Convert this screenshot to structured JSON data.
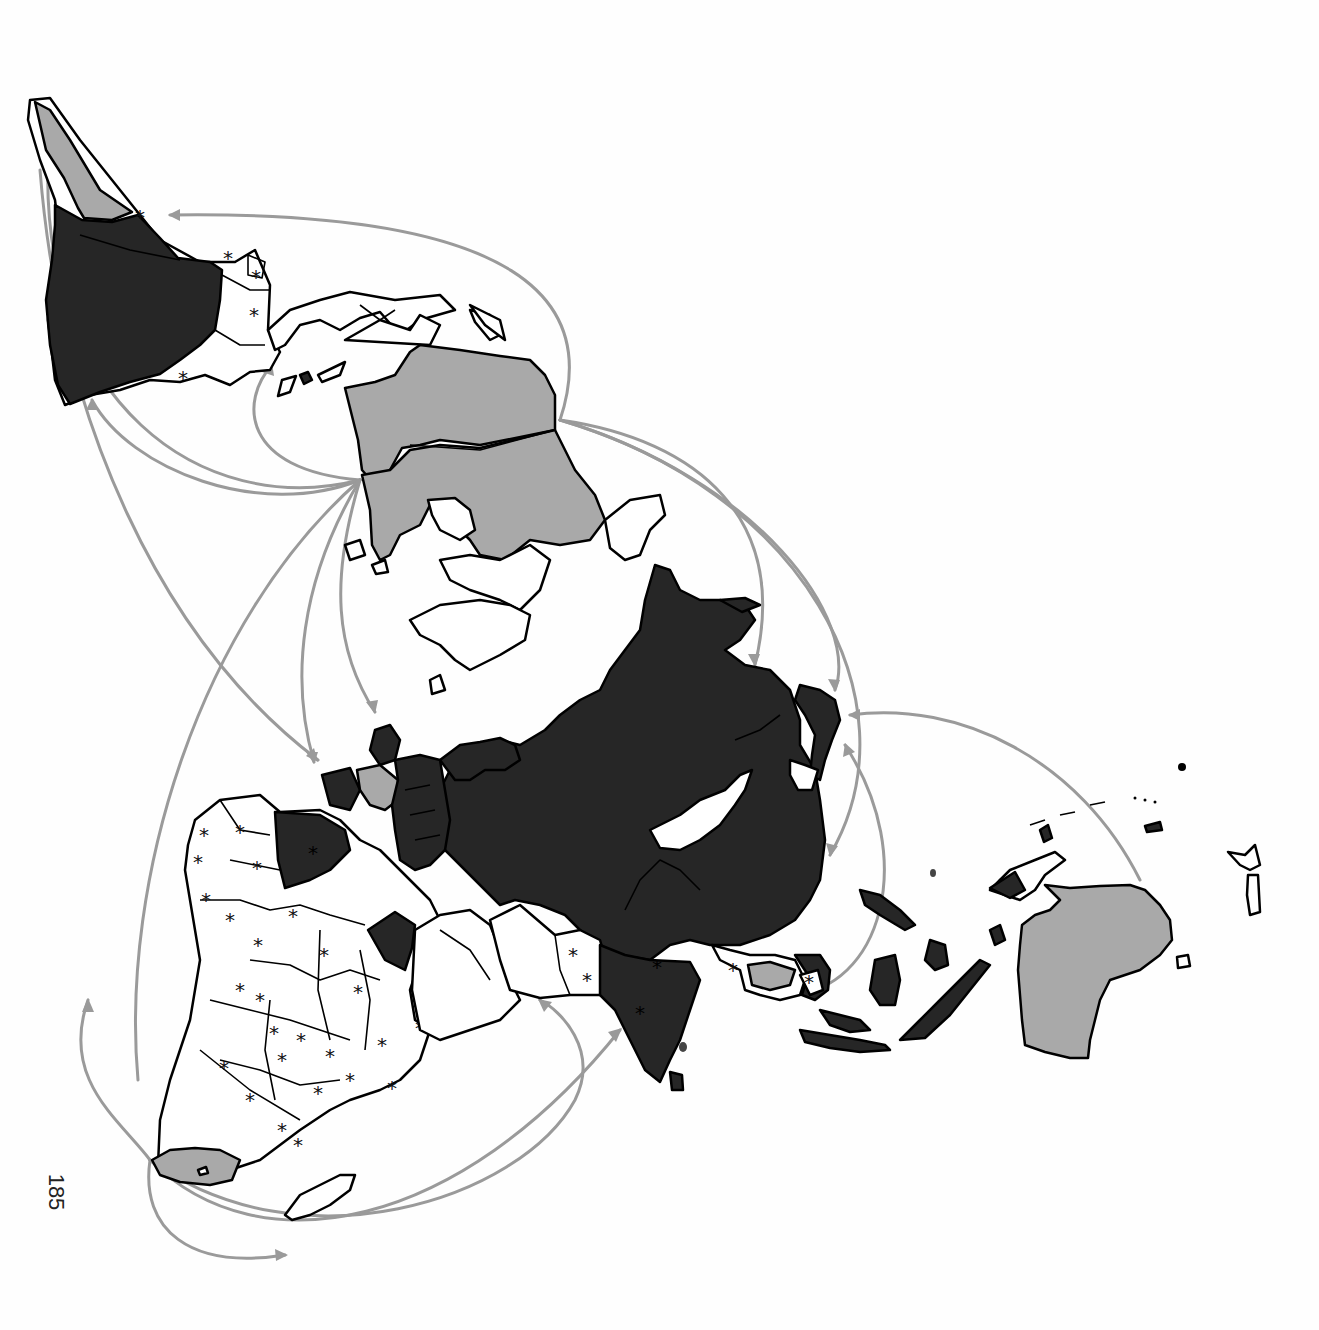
{
  "page": {
    "page_number": "185",
    "page_number_orientation": "rotated 90deg clockwise"
  },
  "map": {
    "type": "thematic world map (rotated projection, south at upper-left)",
    "legend_visible": false,
    "colors": {
      "dark_fill": "#262626",
      "grey_fill": "#a9a9a9",
      "white_fill": "#ffffff",
      "outline": "#000000",
      "flow_arrows": "#9a9a9a"
    },
    "categories": [
      {
        "shade": "dark",
        "regions": [
          "Argentina / southern South America",
          "Mexico",
          "Western & Central Europe",
          "Russia / Soviet Union",
          "China",
          "India",
          "Indonesia",
          "Japan",
          "Philippines",
          "Algeria",
          "Egypt",
          "Northern Korea"
        ]
      },
      {
        "shade": "grey",
        "regions": [
          "Chile",
          "Canada",
          "United States",
          "France",
          "South Africa",
          "Australia",
          "Thailand"
        ]
      },
      {
        "shade": "white",
        "regions": [
          "Brazil region",
          "Central America",
          "Most of Africa",
          "Middle East",
          "Southeast Asia (partial)",
          "Greenland",
          "Madagascar",
          "New Zealand"
        ]
      }
    ],
    "marker_symbol": "*",
    "marker_meaning": "asterisk marks on selected countries (many in Africa, South America, Asia)",
    "flow_arrows": [
      {
        "from": "North America",
        "to": "South America (upper left)"
      },
      {
        "from": "North America",
        "to": "Western Europe"
      },
      {
        "from": "North America",
        "to": "Europe (multiple arcs)"
      },
      {
        "from": "North America",
        "to": "Japan / East Asia"
      },
      {
        "from": "Australia",
        "to": "Japan / East Asia"
      },
      {
        "from": "Southeast Asia",
        "to": "East Asia"
      },
      {
        "from": "Southern Africa",
        "to": "India"
      },
      {
        "from": "Southern Africa",
        "to": "Middle East"
      },
      {
        "from": "Southern Africa",
        "to": "South America"
      },
      {
        "from": "Southern Africa",
        "to": "Indian Ocean"
      }
    ]
  }
}
